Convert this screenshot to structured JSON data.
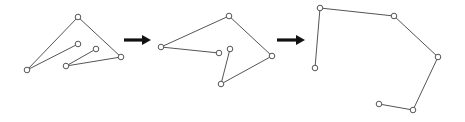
{
  "colors": {
    "background": "#ffffff",
    "line": "#555555",
    "arrow": "#111111"
  },
  "figures": [
    {
      "name": "chain-state-1",
      "nodes": [
        [
          78,
          44
        ],
        [
          27,
          70
        ],
        [
          78,
          17
        ],
        [
          121,
          57
        ],
        [
          66,
          66
        ],
        [
          96,
          49
        ]
      ]
    },
    {
      "name": "chain-state-2",
      "nodes": [
        [
          219,
          53
        ],
        [
          161,
          47
        ],
        [
          229,
          16
        ],
        [
          272,
          56
        ],
        [
          221,
          84
        ],
        [
          230,
          49
        ]
      ]
    },
    {
      "name": "chain-state-3",
      "nodes": [
        [
          315,
          68
        ],
        [
          320,
          8
        ],
        [
          394,
          16
        ],
        [
          438,
          57
        ],
        [
          413,
          110
        ],
        [
          379,
          104
        ]
      ]
    }
  ],
  "arrows": [
    {
      "name": "arrow-1",
      "x1": 124,
      "x2": 151,
      "y": 40
    },
    {
      "name": "arrow-2",
      "x1": 277,
      "x2": 305,
      "y": 40
    }
  ]
}
